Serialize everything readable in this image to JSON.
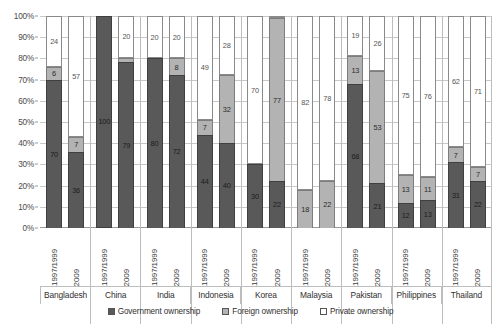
{
  "chart_data": {
    "type": "bar",
    "subtype": "stacked-percent-column",
    "title": "",
    "xlabel": "",
    "ylabel": "",
    "ylim": [
      0,
      100
    ],
    "ytick_labels": [
      "0%",
      "10%",
      "20%",
      "30%",
      "40%",
      "50%",
      "60%",
      "70%",
      "80%",
      "90%",
      "100%"
    ],
    "ytick_values": [
      0,
      10,
      20,
      30,
      40,
      50,
      60,
      70,
      80,
      90,
      100
    ],
    "grid": true,
    "legend_position": "bottom",
    "series": [
      {
        "name": "Government ownership",
        "key": "gov",
        "color": "#595959"
      },
      {
        "name": "Foreign ownership",
        "key": "foreign",
        "color": "#b3b3b3"
      },
      {
        "name": "Private ownership",
        "key": "private",
        "color": "#ffffff"
      }
    ],
    "period_labels": [
      "1997/1999",
      "2009"
    ],
    "categories": [
      "Bangladesh",
      "China",
      "India",
      "Indonesia",
      "Korea",
      "Malaysia",
      "Pakistan",
      "Philippines",
      "Thailand"
    ],
    "groups": [
      {
        "country": "Bangladesh",
        "bars": [
          {
            "period": "1997/1999",
            "gov": 70,
            "foreign": 6,
            "private": 24
          },
          {
            "period": "2009",
            "gov": 36,
            "foreign": 7,
            "private": 57
          }
        ]
      },
      {
        "country": "China",
        "bars": [
          {
            "period": "1997/1999",
            "gov": 100,
            "foreign": 0,
            "private": 0
          },
          {
            "period": "2009",
            "gov": 79,
            "foreign": 2,
            "private": 20
          }
        ]
      },
      {
        "country": "India",
        "bars": [
          {
            "period": "1997/1999",
            "gov": 80,
            "foreign": 0,
            "private": 20
          },
          {
            "period": "2009",
            "gov": 72,
            "foreign": 8,
            "private": 20
          }
        ]
      },
      {
        "country": "Indonesia",
        "bars": [
          {
            "period": "1997/1999",
            "gov": 44,
            "foreign": 7,
            "private": 49
          },
          {
            "period": "2009",
            "gov": 40,
            "foreign": 32,
            "private": 28
          }
        ]
      },
      {
        "country": "Korea",
        "bars": [
          {
            "period": "1997/1999",
            "gov": 30,
            "foreign": 0,
            "private": 70
          },
          {
            "period": "2009",
            "gov": 22,
            "foreign": 77,
            "private": 1
          }
        ]
      },
      {
        "country": "Malaysia",
        "bars": [
          {
            "period": "1997/1999",
            "gov": 0,
            "foreign": 18,
            "private": 82
          },
          {
            "period": "2009",
            "gov": 0,
            "foreign": 22,
            "private": 78
          }
        ]
      },
      {
        "country": "Pakistan",
        "bars": [
          {
            "period": "1997/1999",
            "gov": 68,
            "foreign": 13,
            "private": 19
          },
          {
            "period": "2009",
            "gov": 21,
            "foreign": 53,
            "private": 26
          }
        ]
      },
      {
        "country": "Philippines",
        "bars": [
          {
            "period": "1997/1999",
            "gov": 12,
            "foreign": 13,
            "private": 75
          },
          {
            "period": "2009",
            "gov": 13,
            "foreign": 11,
            "private": 76
          }
        ]
      },
      {
        "country": "Thailand",
        "bars": [
          {
            "period": "1997/1999",
            "gov": 31,
            "foreign": 7,
            "private": 62
          },
          {
            "period": "2009",
            "gov": 22,
            "foreign": 7,
            "private": 71
          }
        ]
      }
    ]
  },
  "legend": {
    "items": [
      {
        "label": "Government ownership",
        "key": "gov"
      },
      {
        "label": "Foreign ownership",
        "key": "foreign"
      },
      {
        "label": "Private ownership",
        "key": "private"
      }
    ]
  }
}
